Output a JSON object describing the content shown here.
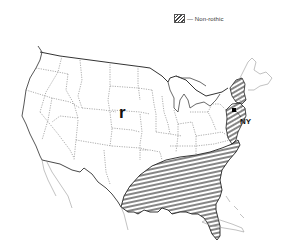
{
  "legend": {
    "label": "— Non-rothic",
    "pattern": "diagonal-hatch"
  },
  "map": {
    "title": "Rhotic vs. non-rhotic speech regions, United States",
    "labels": {
      "rhotic": "r",
      "city": "NY"
    },
    "regions": [
      {
        "name": "Southern non-rhotic region",
        "pattern": "horizontal-hatch"
      },
      {
        "name": "Eastern New England non-rhotic region",
        "pattern": "diagonal-hatch"
      },
      {
        "name": "New York City area non-rhotic region",
        "pattern": "diagonal-hatch"
      }
    ],
    "colors": {
      "line": "#333333",
      "state_border": "#777777",
      "background": "#ffffff"
    }
  }
}
